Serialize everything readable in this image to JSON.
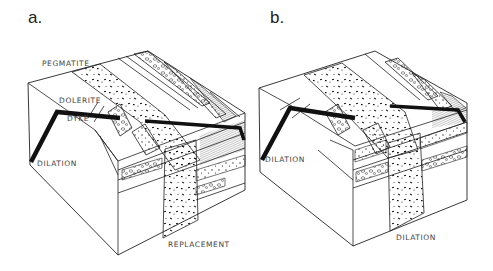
{
  "figure": {
    "panels": [
      {
        "id": "a",
        "label": "a.",
        "annotations": {
          "pegmatite": "PEGMATITE",
          "dolerite": "DOLERITE",
          "dyke": "DYKE",
          "dilation": "DILATION",
          "replacement": "REPLACEMENT"
        }
      },
      {
        "id": "b",
        "label": "b.",
        "annotations": {
          "dilation_left": "DILATION",
          "dilation_bottom": "DILATION"
        }
      }
    ],
    "colors": {
      "line": "#222222",
      "dyke": "#111111",
      "background": "#ffffff"
    }
  }
}
